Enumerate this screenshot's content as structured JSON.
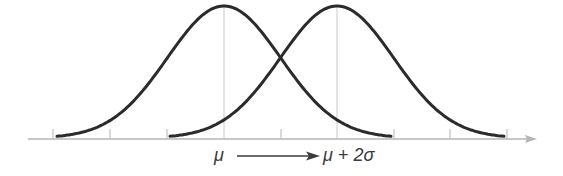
{
  "diagram": {
    "colors": {
      "curve": "#2b2b2b",
      "axis": "#b5b5b5",
      "guide": "#c8c8c8",
      "text": "#3a3a3a"
    },
    "labels": {
      "left_mean": "μ",
      "right_mean": "μ + 2σ"
    },
    "axis": {
      "tick_count": 9,
      "tick_unit": "sigma",
      "has_arrow": true
    },
    "curves": [
      {
        "name": "original-distribution",
        "mean_label": "μ",
        "mean_tick_index": 3
      },
      {
        "name": "shifted-distribution",
        "mean_label": "μ + 2σ",
        "mean_tick_index": 5
      }
    ],
    "shift_arrow": {
      "from": "μ",
      "to": "μ + 2σ"
    }
  }
}
